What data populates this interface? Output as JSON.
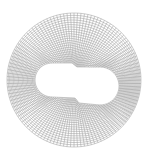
{
  "diagram": {
    "type": "structured-mesh",
    "line_color": "#8c8c8c",
    "background": "#ffffff",
    "outer_boundary": {
      "shape": "circle",
      "cx": 74,
      "cy": 80,
      "r": 67
    },
    "inner_boundary": {
      "shape": "two-lobed cutout",
      "left_lobe": {
        "cx": 52,
        "cy": 80,
        "r": 17
      },
      "right_lobe": {
        "cx": 100,
        "cy": 86,
        "r": 19
      },
      "top_edge": [
        [
          52,
          63
        ],
        [
          72,
          63
        ],
        [
          77,
          67
        ],
        [
          100,
          67
        ]
      ],
      "bottom_edge": [
        [
          100,
          105
        ],
        [
          79,
          103
        ],
        [
          75,
          98
        ],
        [
          52,
          97
        ]
      ]
    },
    "grid": {
      "angular_divisions": 120,
      "radial_divisions": 22
    }
  }
}
